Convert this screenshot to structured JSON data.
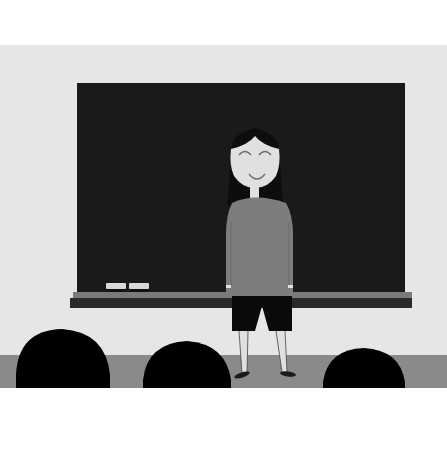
{
  "scene": {
    "description": "Illustration of a smiling girl standing in front of a chalkboard, facing an audience of silhouetted heads",
    "colors": {
      "background_top": "#ffffff",
      "wall": "#e6e6e6",
      "floor": "#8a8a8a",
      "background_bottom": "#ffffff",
      "chalkboard": "#1a1a1a",
      "ledge_top": "#7a7a7a",
      "ledge_front": "#2a2a2a",
      "eraser_top": "#d9d9d9",
      "eraser_base": "#111111",
      "skin": "#e0e0e0",
      "hair": "#0d0d0d",
      "shirt": "#7d7d7d",
      "shorts": "#0a0a0a",
      "shoes": "#1a1a1a",
      "audience": "#000000",
      "face_lines": "#6e6e6e"
    },
    "elements": [
      "chalkboard",
      "chalk-ledge",
      "erasers",
      "teacher-girl",
      "audience-heads"
    ],
    "audience_count": 3,
    "eraser_count": 2
  }
}
